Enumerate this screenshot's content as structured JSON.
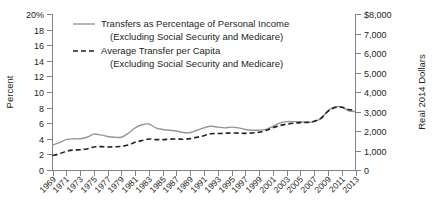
{
  "chart_data": {
    "type": "line",
    "title": "",
    "xlabel": "",
    "ylabel": "Percent",
    "y2label": "Real 2014 Dollars",
    "grid": false,
    "legend_position": "top-center",
    "x": [
      1969,
      1970,
      1971,
      1972,
      1973,
      1974,
      1975,
      1976,
      1977,
      1978,
      1979,
      1980,
      1981,
      1982,
      1983,
      1984,
      1985,
      1986,
      1987,
      1988,
      1989,
      1990,
      1991,
      1992,
      1993,
      1994,
      1995,
      1996,
      1997,
      1998,
      1999,
      2000,
      2001,
      2002,
      2003,
      2004,
      2005,
      2006,
      2007,
      2008,
      2009,
      2010,
      2011,
      2012,
      2013
    ],
    "xtick_labels": [
      "1969",
      "1971",
      "1973",
      "1975",
      "1977",
      "1979",
      "1981",
      "1983",
      "1985",
      "1987",
      "1989",
      "1991",
      "1993",
      "1995",
      "1997",
      "1999",
      "2001",
      "2003",
      "2005",
      "2007",
      "2009",
      "2011",
      "2013"
    ],
    "xlim": [
      1969,
      2013
    ],
    "ylim": [
      0,
      20
    ],
    "ytick_labels": [
      "20%",
      "18",
      "16",
      "14",
      "12",
      "10",
      "8",
      "6",
      "4",
      "2",
      "0"
    ],
    "ytick_values": [
      20,
      18,
      16,
      14,
      12,
      10,
      8,
      6,
      4,
      2,
      0
    ],
    "y2lim": [
      0,
      8000
    ],
    "y2tick_labels": [
      "$8,000",
      "7,000",
      "6,000",
      "5,000",
      "4,000",
      "3,000",
      "2,000",
      "1,000",
      "0"
    ],
    "y2tick_values": [
      8000,
      7000,
      6000,
      5000,
      4000,
      3000,
      2000,
      1000,
      0
    ],
    "series": [
      {
        "name": "Transfers as Percentage of Personal Income (Excluding Social Security and Medicare)",
        "legend_line1": "Transfers as Percentage of Personal Income",
        "legend_line2": "(Excluding Social Security and Medicare)",
        "style": "solid",
        "color": "#939598",
        "axis": "left",
        "unit": "percent",
        "values": [
          3.2,
          3.5,
          3.9,
          4.0,
          4.0,
          4.2,
          4.6,
          4.5,
          4.3,
          4.2,
          4.2,
          4.7,
          5.4,
          5.8,
          5.9,
          5.4,
          5.2,
          5.1,
          5.0,
          4.8,
          4.8,
          5.1,
          5.4,
          5.6,
          5.5,
          5.4,
          5.5,
          5.4,
          5.2,
          5.1,
          5.1,
          5.2,
          5.6,
          6.0,
          6.2,
          6.2,
          6.2,
          6.1,
          6.2,
          6.6,
          7.6,
          8.1,
          8.1,
          7.6,
          7.5
        ]
      },
      {
        "name": "Average Transfer per Capita (Excluding Social Security and Medicare)",
        "legend_line1": "Average Transfer per Capita",
        "legend_line2": "(Excluding Social Security and Medicare)",
        "style": "dashed",
        "color": "#231f20",
        "axis": "right",
        "unit": "dollars",
        "values": [
          740,
          830,
          960,
          1020,
          1040,
          1080,
          1180,
          1200,
          1180,
          1190,
          1210,
          1280,
          1420,
          1510,
          1590,
          1560,
          1560,
          1580,
          1590,
          1580,
          1610,
          1680,
          1760,
          1860,
          1870,
          1880,
          1900,
          1890,
          1880,
          1900,
          1940,
          2030,
          2170,
          2280,
          2350,
          2400,
          2430,
          2440,
          2500,
          2660,
          3010,
          3200,
          3220,
          3100,
          3060
        ]
      }
    ]
  }
}
